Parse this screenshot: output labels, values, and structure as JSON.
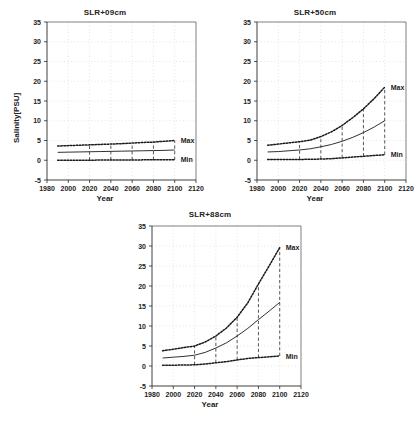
{
  "figure": {
    "background": "#ffffff",
    "ink_color": "#1a1a1a"
  },
  "axis": {
    "xlabel": "Year",
    "ylabel": "Salinity[PSU]",
    "xticks": [
      1980,
      2000,
      2020,
      2040,
      2060,
      2080,
      2100,
      2120
    ],
    "yticks": [
      -5,
      0,
      5,
      10,
      15,
      20,
      25,
      30,
      35
    ],
    "xlim": [
      1980,
      2120
    ],
    "ylim": [
      -5,
      35
    ]
  },
  "series_labels": {
    "max": "Max",
    "min": "Min"
  },
  "chart_data": [
    {
      "type": "line",
      "title": "SLR+09cm",
      "xlabel": "Year",
      "ylabel": "Salinity[PSU]",
      "xlim": [
        1980,
        2120
      ],
      "ylim": [
        -5,
        35
      ],
      "grid": true,
      "legend_position": "right-inline",
      "x": [
        1990,
        2000,
        2010,
        2020,
        2030,
        2040,
        2050,
        2060,
        2070,
        2080,
        2090,
        2100
      ],
      "series": [
        {
          "name": "Max",
          "style": "dotted",
          "values": [
            3.6,
            3.7,
            3.8,
            3.9,
            4.0,
            4.1,
            4.2,
            4.35,
            4.5,
            4.6,
            4.8,
            5.0
          ]
        },
        {
          "name": "Mean",
          "style": "solid",
          "values": [
            2.0,
            2.05,
            2.1,
            2.15,
            2.2,
            2.25,
            2.3,
            2.35,
            2.4,
            2.45,
            2.5,
            2.6
          ]
        },
        {
          "name": "Min",
          "style": "dotted",
          "values": [
            0.0,
            0.0,
            0.0,
            0.0,
            0.05,
            0.05,
            0.05,
            0.05,
            0.1,
            0.1,
            0.1,
            0.1
          ]
        }
      ],
      "errorbars": [
        {
          "x": 2020,
          "low": 0.0,
          "high": 3.9
        },
        {
          "x": 2040,
          "low": 0.05,
          "high": 4.1
        },
        {
          "x": 2060,
          "low": 0.05,
          "high": 4.35
        },
        {
          "x": 2080,
          "low": 0.1,
          "high": 4.6
        },
        {
          "x": 2100,
          "low": 0.1,
          "high": 5.0
        }
      ]
    },
    {
      "type": "line",
      "title": "SLR+50cm",
      "xlabel": "Year",
      "ylabel": "Salinity[PSU]",
      "xlim": [
        1980,
        2120
      ],
      "ylim": [
        -5,
        35
      ],
      "grid": true,
      "legend_position": "right-inline",
      "x": [
        1990,
        2000,
        2010,
        2020,
        2030,
        2040,
        2050,
        2060,
        2070,
        2080,
        2090,
        2100
      ],
      "series": [
        {
          "name": "Max",
          "style": "dotted",
          "values": [
            3.8,
            4.1,
            4.4,
            4.7,
            5.1,
            6.0,
            7.2,
            8.8,
            10.8,
            13.0,
            15.6,
            18.5
          ]
        },
        {
          "name": "Mean",
          "style": "solid",
          "values": [
            2.1,
            2.2,
            2.4,
            2.6,
            2.9,
            3.4,
            4.0,
            4.8,
            5.8,
            7.0,
            8.4,
            10.0
          ]
        },
        {
          "name": "Min",
          "style": "dotted",
          "values": [
            0.2,
            0.2,
            0.2,
            0.2,
            0.25,
            0.3,
            0.4,
            0.6,
            0.8,
            1.0,
            1.2,
            1.4
          ]
        }
      ],
      "errorbars": [
        {
          "x": 2020,
          "low": 0.2,
          "high": 4.7
        },
        {
          "x": 2040,
          "low": 0.3,
          "high": 6.0
        },
        {
          "x": 2060,
          "low": 0.6,
          "high": 8.8
        },
        {
          "x": 2080,
          "low": 1.0,
          "high": 13.0
        },
        {
          "x": 2100,
          "low": 1.4,
          "high": 18.5
        }
      ]
    },
    {
      "type": "line",
      "title": "SLR+88cm",
      "xlabel": "Year",
      "ylabel": "Salinity[PSU]",
      "xlim": [
        1980,
        2120
      ],
      "ylim": [
        -5,
        35
      ],
      "grid": true,
      "legend_position": "right-inline",
      "x": [
        1990,
        2000,
        2010,
        2020,
        2030,
        2040,
        2050,
        2060,
        2070,
        2080,
        2090,
        2100
      ],
      "series": [
        {
          "name": "Max",
          "style": "dotted",
          "values": [
            3.8,
            4.2,
            4.6,
            5.0,
            6.0,
            7.5,
            9.5,
            12.2,
            15.8,
            20.5,
            25.0,
            29.6
          ]
        },
        {
          "name": "Mean",
          "style": "solid",
          "values": [
            2.0,
            2.2,
            2.4,
            2.7,
            3.4,
            4.5,
            5.8,
            7.5,
            9.4,
            11.6,
            13.7,
            15.9
          ]
        },
        {
          "name": "Min",
          "style": "dotted",
          "values": [
            0.2,
            0.2,
            0.25,
            0.3,
            0.5,
            0.8,
            1.1,
            1.5,
            1.9,
            2.1,
            2.3,
            2.5
          ]
        }
      ],
      "errorbars": [
        {
          "x": 2020,
          "low": 0.3,
          "high": 5.0
        },
        {
          "x": 2040,
          "low": 0.8,
          "high": 7.5
        },
        {
          "x": 2060,
          "low": 1.5,
          "high": 12.2
        },
        {
          "x": 2080,
          "low": 2.1,
          "high": 20.5
        },
        {
          "x": 2100,
          "low": 2.5,
          "high": 29.6
        }
      ]
    }
  ]
}
